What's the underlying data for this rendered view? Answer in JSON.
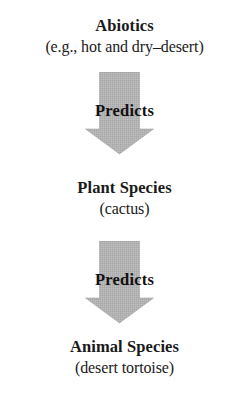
{
  "figure": {
    "background_color": "#ffffff",
    "text_color": "#1a1a1a",
    "arrow_color": "#b0b0b0",
    "arrow_edge_color": "#9a9a9a"
  },
  "nodes": [
    {
      "id": "abiotics",
      "title": "Abiotics",
      "subtitle": "(e.g., hot and dry–desert)"
    },
    {
      "id": "plant-species",
      "title": "Plant Species",
      "subtitle": "(cactus)"
    },
    {
      "id": "animal-species",
      "title": "Animal Species",
      "subtitle": "(desert tortoise)"
    }
  ],
  "arrows": [
    {
      "id": "arrow-1",
      "label": "Predicts",
      "direction": "down",
      "from": "abiotics",
      "to": "plant-species"
    },
    {
      "id": "arrow-2",
      "label": "Predicts",
      "direction": "down",
      "from": "plant-species",
      "to": "animal-species"
    }
  ]
}
